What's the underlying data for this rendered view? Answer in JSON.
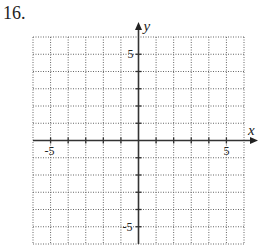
{
  "problem": {
    "number": "16."
  },
  "graph": {
    "x_axis_label": "x",
    "y_axis_label": "y",
    "x_min": -6,
    "x_max": 6,
    "y_min": -6,
    "y_max": 6,
    "grid_step": 1,
    "tick_labels": {
      "x_neg": "-5",
      "x_pos": "5",
      "y_pos": "5",
      "y_neg": "-5"
    }
  },
  "chart_data": {
    "type": "scatter",
    "title": "",
    "xlabel": "x",
    "ylabel": "y",
    "xlim": [
      -6,
      6
    ],
    "ylim": [
      -6,
      6
    ],
    "grid": true,
    "x_tick_labels": [
      "-5",
      "5"
    ],
    "y_tick_labels": [
      "5",
      "-5"
    ],
    "series": []
  }
}
